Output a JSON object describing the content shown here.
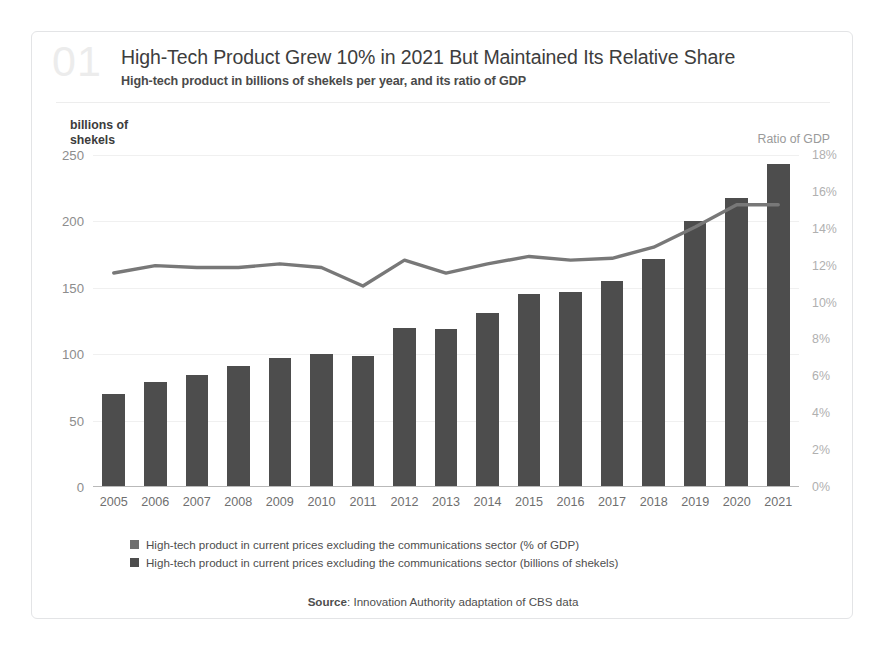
{
  "card": {
    "badge_number": "01",
    "title": "High-Tech Product Grew 10% in 2021 But Maintained Its Relative Share",
    "subtitle": "High-tech product in billions of shekels per year, and its ratio of GDP",
    "left_axis_caption": "billions of\nshekels",
    "right_axis_caption": "Ratio of GDP",
    "source_prefix": "Source",
    "source_separator": ": ",
    "source_text": "Innovation Authority adaptation of CBS data"
  },
  "colors": {
    "bar": "#4d4d4d",
    "line": "#787878",
    "grid": "#f0f0f0",
    "axis": "#b9b9b9",
    "card_border": "#e3e4e6",
    "badge": "#ececec",
    "left_tick_text": "#8d8d8d",
    "right_tick_text": "#b0b0b0",
    "x_tick_text": "#6f6f6f",
    "title_text": "#3d3d3d",
    "background": "#ffffff"
  },
  "legend": {
    "items": [
      {
        "swatch_color": "#6f6f6f",
        "label": "High-tech product in current prices excluding the communications sector (% of GDP)"
      },
      {
        "swatch_color": "#4d4d4d",
        "label": "High-tech product in current prices excluding the communications sector (billions of shekels)"
      }
    ]
  },
  "chart_data": {
    "type": "bar",
    "title": "High-Tech Product Grew 10% in 2021 But Maintained Its Relative Share",
    "subtitle": "High-tech product in billions of shekels per year, and its ratio of GDP",
    "xlabel": "",
    "ylabel": "billions of shekels",
    "y2label": "Ratio of GDP",
    "categories": [
      "2005",
      "2006",
      "2007",
      "2008",
      "2009",
      "2010",
      "2011",
      "2012",
      "2013",
      "2014",
      "2015",
      "2016",
      "2017",
      "2018",
      "2019",
      "2020",
      "2021"
    ],
    "ylim": [
      0,
      250
    ],
    "y2lim": [
      0,
      18
    ],
    "yticks": [
      0,
      50,
      100,
      150,
      200,
      250
    ],
    "ytick_labels": [
      "0",
      "50",
      "100",
      "150",
      "200",
      "250"
    ],
    "y2ticks": [
      0,
      2,
      4,
      6,
      8,
      10,
      12,
      14,
      16,
      18
    ],
    "y2tick_labels": [
      "0%",
      "2%",
      "4%",
      "6%",
      "8%",
      "10%",
      "12%",
      "14%",
      "16%",
      "18%"
    ],
    "grid": true,
    "legend_position": "bottom-left",
    "series": [
      {
        "name": "High-tech product in current prices excluding the communications sector (billions of shekels)",
        "type": "bar",
        "axis": "left",
        "unit": "billions of shekels",
        "color": "#4d4d4d",
        "values": [
          70,
          79,
          84,
          91,
          97,
          100,
          99,
          120,
          119,
          131,
          145,
          147,
          155,
          172,
          200,
          218,
          243
        ]
      },
      {
        "name": "High-tech product in current prices excluding the communications sector (% of GDP)",
        "type": "line",
        "axis": "right",
        "unit": "% of GDP",
        "color": "#787878",
        "values": [
          11.6,
          12.0,
          11.9,
          11.9,
          12.1,
          11.9,
          10.9,
          12.3,
          11.6,
          12.1,
          12.5,
          12.3,
          12.4,
          13.0,
          14.1,
          15.3,
          15.3
        ]
      }
    ]
  }
}
